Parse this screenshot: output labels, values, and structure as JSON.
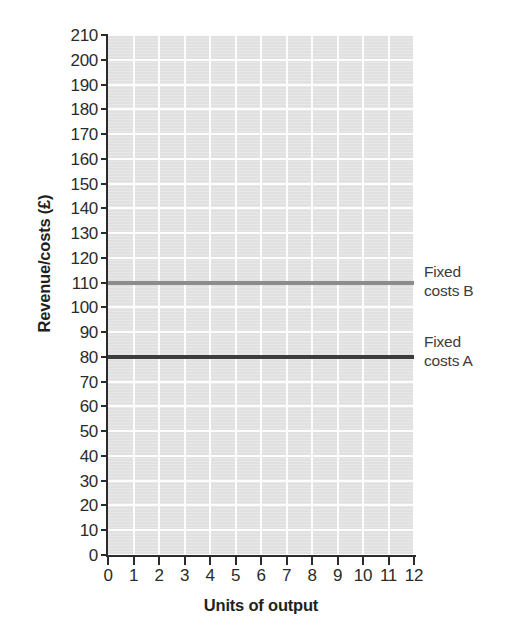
{
  "chart_data": {
    "type": "line",
    "title": "",
    "xlabel": "Units of output",
    "ylabel": "Revenue/costs (£)",
    "xlim": [
      0,
      12
    ],
    "ylim": [
      0,
      210
    ],
    "grid": true,
    "legend_position": "right-inline-annotations",
    "x_ticks": [
      "0",
      "1",
      "2",
      "3",
      "4",
      "5",
      "6",
      "7",
      "8",
      "9",
      "10",
      "11",
      "12"
    ],
    "y_ticks": [
      "0",
      "10",
      "20",
      "30",
      "40",
      "50",
      "60",
      "70",
      "80",
      "90",
      "100",
      "110",
      "120",
      "130",
      "140",
      "150",
      "160",
      "170",
      "180",
      "190",
      "200",
      "210"
    ],
    "x": [
      0,
      12
    ],
    "series": [
      {
        "name": "Fixed costs B",
        "annotation_line1": "Fixed",
        "annotation_line2": "costs B",
        "values": [
          110,
          110
        ],
        "constant_value": 110,
        "color": "#8c8c8c",
        "linewidth": 4
      },
      {
        "name": "Fixed costs A",
        "annotation_line1": "Fixed",
        "annotation_line2": "costs A",
        "values": [
          80,
          80
        ],
        "constant_value": 80,
        "color": "#3d3d3d",
        "linewidth": 4
      }
    ],
    "plot_background": "#e4e4e4",
    "gridline_color": "#fdfdfd",
    "axis_color": "#2b2b2b",
    "page_background": "#ffffff"
  }
}
